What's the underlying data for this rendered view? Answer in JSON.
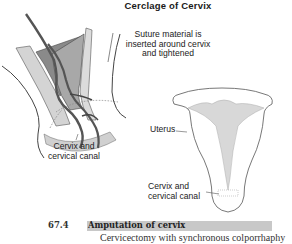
{
  "figure": {
    "title": "Cerclage of Cervix",
    "labels": {
      "suture": [
        "Suture material is",
        "inserted around cervix",
        "and tightened"
      ],
      "cervix_left": [
        "Cervix and",
        "cervical canal"
      ],
      "uterus": "Uterus",
      "cervix_right": [
        "Cervix and",
        "cervical canal"
      ]
    }
  },
  "section": {
    "number": "67.4",
    "title": "Amputation of cervix",
    "subtitle": "Cervicectomy with synchronous colporrhaphy"
  },
  "colors": {
    "highlight_bar": "#c8c8c8",
    "tissue_light": "#d4d4d4",
    "tissue_mid": "#a8a8a8",
    "tissue_dark": "#808080",
    "line": "#333333"
  }
}
